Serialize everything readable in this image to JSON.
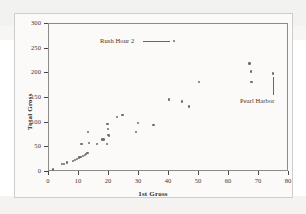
{
  "figure": {
    "background_color": "#ffffff",
    "frame_color": "#8d8a87",
    "point_color": "#6e6b69"
  },
  "chart_data": {
    "type": "scatter",
    "title": "",
    "xlabel": "1st Gross",
    "ylabel": "Total Gross",
    "xlim": [
      0,
      80
    ],
    "ylim": [
      0,
      300
    ],
    "xticks": [
      0,
      10,
      20,
      30,
      40,
      50,
      60,
      70,
      80
    ],
    "yticks": [
      0,
      50,
      100,
      150,
      200,
      250,
      300
    ],
    "grid": false,
    "legend": "none",
    "points": [
      {
        "x": 1.6,
        "y": 3
      },
      {
        "x": 4.6,
        "y": 14
      },
      {
        "x": 5.4,
        "y": 14
      },
      {
        "x": 6.4,
        "y": 17
      },
      {
        "x": 8.3,
        "y": 20
      },
      {
        "x": 8.9,
        "y": 22
      },
      {
        "x": 9.6,
        "y": 24
      },
      {
        "x": 10.3,
        "y": 27
      },
      {
        "x": 10.8,
        "y": 29
      },
      {
        "x": 11.2,
        "y": 55
      },
      {
        "x": 11.6,
        "y": 30
      },
      {
        "x": 12.3,
        "y": 33
      },
      {
        "x": 12.7,
        "y": 35
      },
      {
        "x": 13.1,
        "y": 37
      },
      {
        "x": 13.3,
        "y": 79
      },
      {
        "x": 13.6,
        "y": 57
      },
      {
        "x": 16.3,
        "y": 55
      },
      {
        "x": 17.9,
        "y": 64
      },
      {
        "x": 18.5,
        "y": 64
      },
      {
        "x": 19.6,
        "y": 55
      },
      {
        "x": 19.8,
        "y": 95
      },
      {
        "x": 20.0,
        "y": 85
      },
      {
        "x": 20.2,
        "y": 73
      },
      {
        "x": 20.4,
        "y": 71
      },
      {
        "x": 23.0,
        "y": 110
      },
      {
        "x": 24.8,
        "y": 114
      },
      {
        "x": 29.4,
        "y": 79
      },
      {
        "x": 30.0,
        "y": 97
      },
      {
        "x": 35.2,
        "y": 93
      },
      {
        "x": 40.4,
        "y": 145
      },
      {
        "x": 42.0,
        "y": 263
      },
      {
        "x": 44.6,
        "y": 141
      },
      {
        "x": 47.0,
        "y": 131
      },
      {
        "x": 50.3,
        "y": 180
      },
      {
        "x": 67.2,
        "y": 218
      },
      {
        "x": 67.6,
        "y": 202
      },
      {
        "x": 67.8,
        "y": 181
      },
      {
        "x": 75.0,
        "y": 198
      }
    ],
    "annotations": [
      {
        "text": "Rush Hour 2",
        "target_x": 42.0,
        "target_y": 263,
        "leader": "horizontal"
      },
      {
        "text": "Pearl Harbor",
        "target_x": 75.0,
        "target_y": 198,
        "leader": "vertical"
      }
    ]
  }
}
